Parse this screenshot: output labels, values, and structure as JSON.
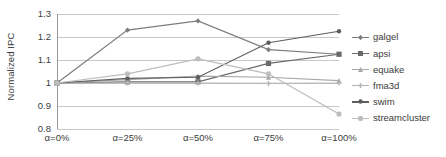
{
  "chart_data": {
    "type": "line",
    "title": "",
    "xlabel": "",
    "ylabel": "Normalized IPC",
    "categories": [
      "α=0%",
      "α=25%",
      "α=50%",
      "α=75%",
      "α=100%"
    ],
    "ylim": [
      0.8,
      1.3
    ],
    "yticks": [
      0.8,
      0.9,
      1.0,
      1.1,
      1.2,
      1.3
    ],
    "ytick_labels": [
      "0.8",
      "0.9",
      "1",
      "1.1",
      "1.2",
      "1.3"
    ],
    "grid": true,
    "legend_position": "right",
    "series": [
      {
        "name": "galgel",
        "color": "#7d7d7d",
        "marker": "diamond",
        "values": [
          1.0,
          1.23,
          1.27,
          1.145,
          1.125
        ]
      },
      {
        "name": "apsi",
        "color": "#6a6a6a",
        "marker": "square",
        "values": [
          1.0,
          1.005,
          1.005,
          1.085,
          1.125
        ]
      },
      {
        "name": "equake",
        "color": "#a8a8a8",
        "marker": "triangle",
        "values": [
          1.0,
          1.015,
          1.03,
          1.025,
          1.01
        ]
      },
      {
        "name": "fma3d",
        "color": "#b5b5b5",
        "marker": "cross",
        "values": [
          1.0,
          1.0,
          1.0,
          0.998,
          1.0
        ]
      },
      {
        "name": "swim",
        "color": "#5e5e5e",
        "marker": "dot",
        "values": [
          1.0,
          1.02,
          1.025,
          1.175,
          1.225
        ]
      },
      {
        "name": "streamcluster",
        "color": "#bdbdbd",
        "marker": "circle",
        "values": [
          1.0,
          1.04,
          1.105,
          1.04,
          0.865
        ]
      }
    ]
  }
}
